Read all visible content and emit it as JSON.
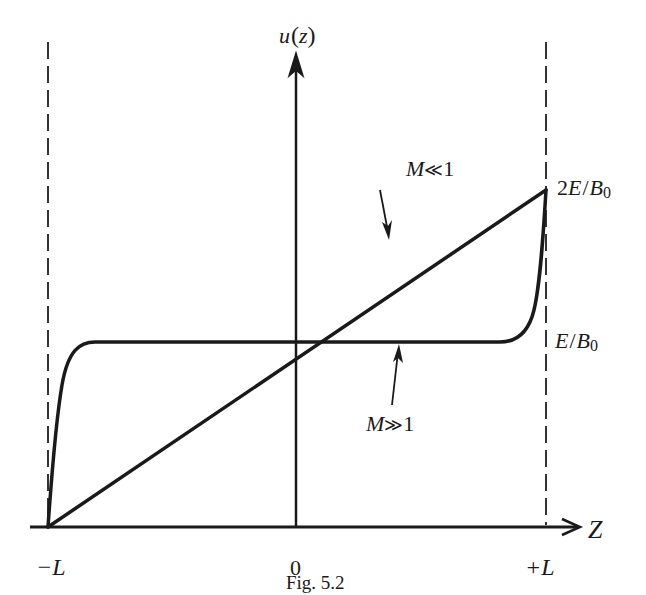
{
  "figure": {
    "caption": "Fig. 5.2",
    "colors": {
      "ink": "#1a1a1a",
      "background": "#ffffff",
      "dashed": "#333333"
    }
  },
  "axes": {
    "y_label_main": "u",
    "y_label_paren_open": "(",
    "y_label_var": "z",
    "y_label_paren_close": ")",
    "x_label": "Z",
    "x_ticks": {
      "left": "−L",
      "center": "0",
      "right": "+L"
    }
  },
  "levels": {
    "upper": {
      "prefix": "2",
      "var_e": "E",
      "slash": "/",
      "var_b": "B",
      "subscript": "0"
    },
    "middle": {
      "var_e": "E",
      "slash": "/",
      "var_b": "B",
      "subscript": "0"
    }
  },
  "curves": {
    "low_m": {
      "label_var": "M",
      "label_rel": "≪",
      "label_num": "1",
      "description": "linear profile from (−L,0) to (+L,2E/B0)"
    },
    "high_m": {
      "label_var": "M",
      "label_rel": "≫",
      "label_num": "1",
      "description": "flat profile at E/B0 with boundary layers at ±L"
    }
  }
}
